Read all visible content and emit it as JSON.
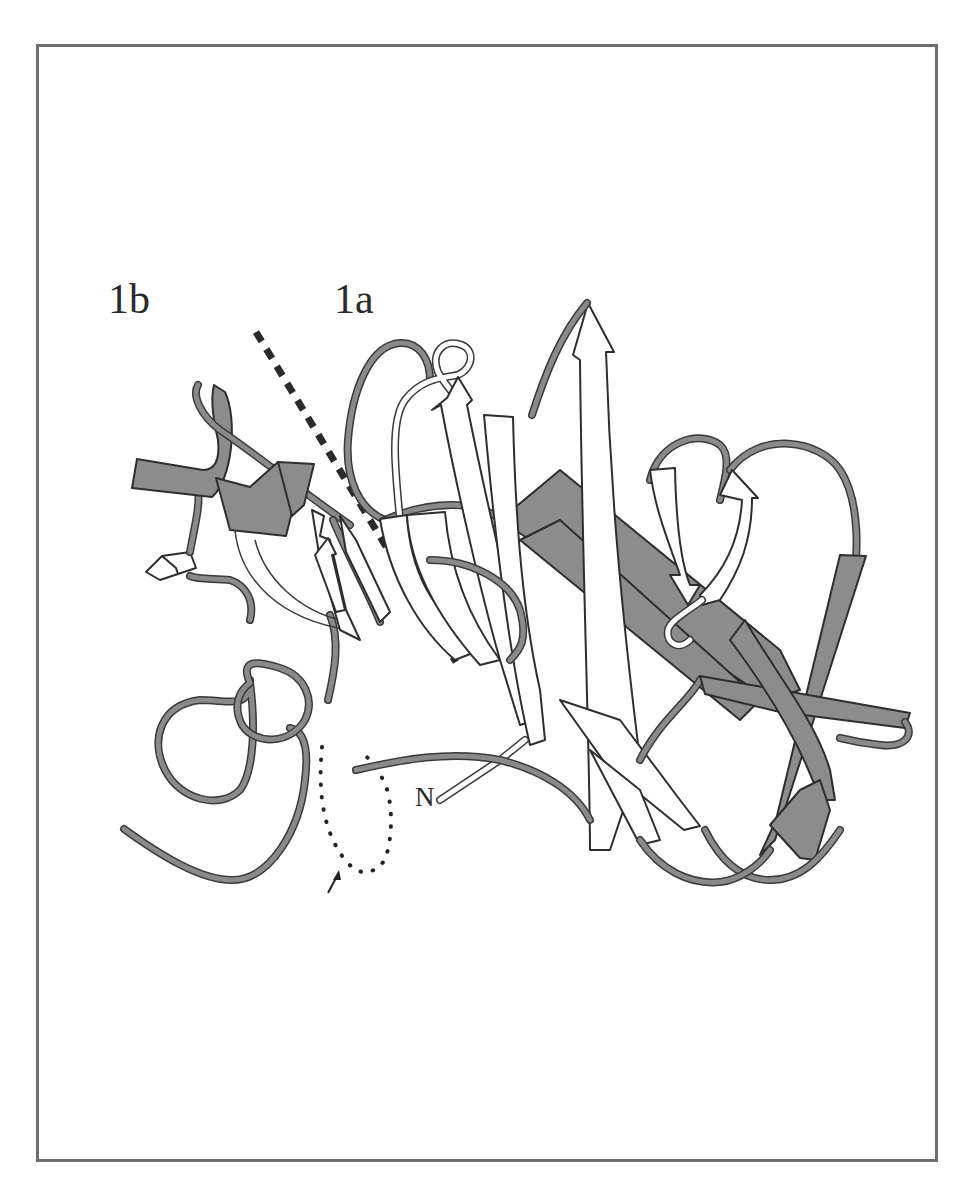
{
  "figure": {
    "labels": {
      "domain_1b": "1b",
      "domain_1a": "1a",
      "n_terminus": "N"
    },
    "annotations": {
      "domain_boundary": "dashed-line",
      "disordered_region": "dotted-loop",
      "arrow_pointer": "arrow-icon"
    },
    "colors": {
      "frame": "#6e6e6e",
      "helix_dark": "#8c8c8c",
      "strand_light": "#ffffff",
      "coil": "#8a8a8a",
      "outline": "#3a3a3a",
      "text": "#2a2a2a"
    },
    "caption": ""
  }
}
